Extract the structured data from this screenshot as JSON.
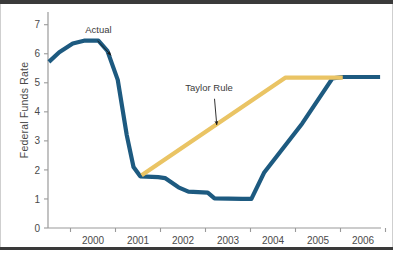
{
  "chart_data": {
    "type": "line",
    "title": "",
    "xlabel": "",
    "ylabel": "Federal Funds Rate",
    "xlim": [
      1999.5,
      2006.9
    ],
    "ylim": [
      0,
      7.3
    ],
    "yticks": [
      "0",
      "1",
      "2",
      "3",
      "4",
      "5",
      "6",
      "7"
    ],
    "ytick_values": [
      0,
      1,
      2,
      3,
      4,
      5,
      6,
      7
    ],
    "xticks": [
      "2000",
      "2001",
      "2002",
      "2003",
      "2004",
      "2005",
      "2006"
    ],
    "xtick_values": [
      2000,
      2001,
      2002,
      2003,
      2004,
      2005,
      2006
    ],
    "grid": false,
    "legend": "annotations",
    "series": [
      {
        "name": "Actual",
        "color": "#1d5a80",
        "points": [
          [
            1999.52,
            5.72
          ],
          [
            1999.75,
            6.05
          ],
          [
            2000.05,
            6.35
          ],
          [
            2000.3,
            6.45
          ],
          [
            2000.62,
            6.45
          ],
          [
            2000.82,
            6.1
          ],
          [
            2001.05,
            5.1
          ],
          [
            2001.25,
            3.2
          ],
          [
            2001.4,
            2.1
          ],
          [
            2001.55,
            1.78
          ],
          [
            2001.95,
            1.75
          ],
          [
            2002.1,
            1.72
          ],
          [
            2002.4,
            1.4
          ],
          [
            2002.62,
            1.25
          ],
          [
            2003.05,
            1.22
          ],
          [
            2003.2,
            1.02
          ],
          [
            2003.82,
            1.0
          ],
          [
            2004.02,
            1.0
          ],
          [
            2004.3,
            1.9
          ],
          [
            2005.15,
            3.6
          ],
          [
            2005.82,
            5.15
          ],
          [
            2006.05,
            5.2
          ],
          [
            2006.88,
            5.2
          ]
        ]
      },
      {
        "name": "Taylor Rule",
        "color": "#eac464",
        "points": [
          [
            2001.58,
            1.82
          ],
          [
            2004.78,
            5.18
          ],
          [
            2006.05,
            5.18
          ]
        ]
      }
    ],
    "annotations": [
      {
        "label": "Actual",
        "text_x": 2000.62,
        "text_y": 6.72,
        "arrow_from_x": 2000.6,
        "arrow_from_y": 6.45,
        "arrow_to_x": 2000.9,
        "arrow_to_y": 5.95
      },
      {
        "label": "Taylor Rule",
        "text_x": 2003.08,
        "text_y": 4.73,
        "arrow_from_x": 2003.2,
        "arrow_from_y": 4.45,
        "arrow_to_x": 2003.25,
        "arrow_to_y": 3.55
      }
    ]
  },
  "axes": {
    "y_axis_title": "Federal Funds Rate"
  }
}
